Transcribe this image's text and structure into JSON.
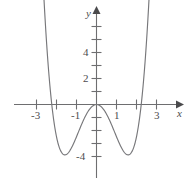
{
  "figure": {
    "axis_labels": {
      "x": "x",
      "y": "y"
    },
    "x_tick_labels": [
      "-3",
      "-1",
      "1",
      "3"
    ],
    "y_tick_labels": [
      "2",
      "4",
      "-4"
    ],
    "colors": {
      "curve": "#77777a",
      "axis": "#6e6e70",
      "text": "#4c4c4e",
      "background": "#ffffff"
    }
  },
  "chart_data": {
    "type": "line",
    "title": "",
    "xlabel": "x",
    "ylabel": "y",
    "xlim": [
      -3.9,
      4.1
    ],
    "ylim": [
      -5.6,
      6.6
    ],
    "grid": false,
    "legend": null,
    "x_ticks": [
      -3,
      -2,
      -1,
      1,
      2,
      3
    ],
    "x_tick_labels_shown": [
      {
        "x": -3,
        "label": "-3"
      },
      {
        "x": -1,
        "label": "-1"
      },
      {
        "x": 1,
        "label": "1"
      },
      {
        "x": 3,
        "label": "3"
      }
    ],
    "y_ticks": [
      -4,
      -3,
      -2,
      -1,
      1,
      2,
      3,
      4,
      5
    ],
    "y_tick_labels_shown": [
      {
        "y": 2,
        "label": "2"
      },
      {
        "y": 4,
        "label": "4"
      },
      {
        "y": -4,
        "label": "-4"
      }
    ],
    "series": [
      {
        "name": "quartic",
        "equation": "y = x^4 - 5x^2",
        "roots": [
          -2.236,
          0,
          2.236
        ],
        "local_maximum": {
          "x": 0,
          "y": 0
        },
        "local_minima": [
          {
            "x": -1.58,
            "y": -6.25
          },
          {
            "x": 1.58,
            "y": -6.25
          }
        ],
        "x": [
          -2.85,
          -2.7,
          -2.55,
          -2.4,
          -2.25,
          -2.1,
          -1.95,
          -1.8,
          -1.65,
          -1.5,
          -1.35,
          -1.2,
          -1.05,
          -0.9,
          -0.75,
          -0.6,
          -0.45,
          -0.3,
          -0.15,
          0,
          0.15,
          0.3,
          0.45,
          0.6,
          0.75,
          0.9,
          1.05,
          1.2,
          1.35,
          1.5,
          1.65,
          1.8,
          1.95,
          2.1,
          2.25,
          2.4,
          2.55,
          2.7,
          2.85
        ],
        "y": [
          25.3,
          16.7,
          9.8,
          4.4,
          0.3,
          -2.6,
          -4.6,
          -5.7,
          -6.2,
          -6.2,
          -5.8,
          -5.1,
          -4.3,
          -3.4,
          -2.5,
          -1.7,
          -1.0,
          -0.4,
          -0.1,
          0,
          -0.1,
          -0.4,
          -1.0,
          -1.7,
          -2.5,
          -3.4,
          -4.3,
          -5.1,
          -5.8,
          -6.2,
          -6.2,
          -5.7,
          -4.6,
          -2.6,
          0.3,
          4.4,
          9.8,
          16.7,
          25.3
        ]
      }
    ]
  }
}
